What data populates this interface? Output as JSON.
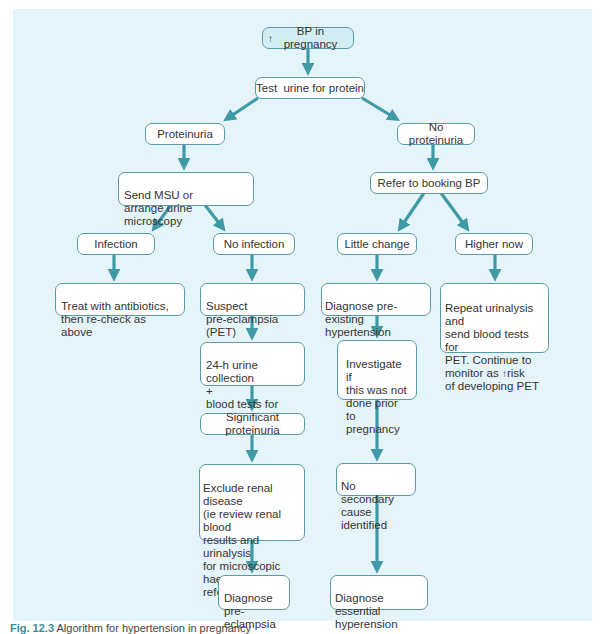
{
  "diagram": {
    "colors": {
      "panel_background": "#e5f4f9",
      "arrow": "#3f9aa6",
      "node_border": "#5a9aa5",
      "node_fill": "#ffffff"
    },
    "nodes": {
      "root": {
        "arrow_glyph": "↑",
        "label": "BP in pregnancy"
      },
      "test_urine": {
        "label": "Test  urine for protein"
      },
      "proteinuria": {
        "label": "Proteinuria"
      },
      "send_msu": {
        "label": "Send MSU or\narrange urine microscopy"
      },
      "infection": {
        "label": "Infection"
      },
      "no_infection": {
        "label": "No infection"
      },
      "treat_antibiotics": {
        "label": "Treat with antibiotics,\nthen re-check as above"
      },
      "suspect_pet": {
        "label": "Suspect\npre-eclampsia (PET)"
      },
      "urine_collection": {
        "label": "24-h urine collection\n+\nblood tests for PET"
      },
      "significant_proteinuria": {
        "label": "Significant proteinuria"
      },
      "exclude_renal": {
        "label": "Exclude renal disease\n(ie review renal blood\nresults and urinalysis\nfor microscopic\nhaematuria)\nrefer if abnormal"
      },
      "diagnose_pre_eclampsia": {
        "label": "Diagnose\npre-eclampsia"
      },
      "no_proteinuria": {
        "label": "No proteinuria"
      },
      "refer_booking": {
        "label": "Refer to booking BP"
      },
      "little_change": {
        "label": "Little change"
      },
      "higher_now": {
        "label": "Higher now"
      },
      "diagnose_preexisting": {
        "label": "Diagnose pre-existing\nhypertension"
      },
      "repeat_urinalysis": {
        "label_part1": "Repeat urinalysis and\nsend blood tests for\nPET. Continue to\nmonitor as ",
        "arrow_glyph": "↑",
        "label_part2": "risk\nof developing PET"
      },
      "investigate": {
        "label": "Investigate if\nthis was not\ndone prior to\npregnancy"
      },
      "no_secondary": {
        "label": "No secondary\ncause identified"
      },
      "diagnose_essential": {
        "label": "Diagnose essential\nhyperension"
      }
    },
    "edges": [
      [
        "root",
        "test_urine"
      ],
      [
        "test_urine",
        "proteinuria"
      ],
      [
        "test_urine",
        "no_proteinuria"
      ],
      [
        "proteinuria",
        "send_msu"
      ],
      [
        "send_msu",
        "infection"
      ],
      [
        "send_msu",
        "no_infection"
      ],
      [
        "infection",
        "treat_antibiotics"
      ],
      [
        "no_infection",
        "suspect_pet"
      ],
      [
        "suspect_pet",
        "urine_collection"
      ],
      [
        "urine_collection",
        "significant_proteinuria"
      ],
      [
        "significant_proteinuria",
        "exclude_renal"
      ],
      [
        "exclude_renal",
        "diagnose_pre_eclampsia"
      ],
      [
        "no_proteinuria",
        "refer_booking"
      ],
      [
        "refer_booking",
        "little_change"
      ],
      [
        "refer_booking",
        "higher_now"
      ],
      [
        "little_change",
        "diagnose_preexisting"
      ],
      [
        "higher_now",
        "repeat_urinalysis"
      ],
      [
        "diagnose_preexisting",
        "investigate"
      ],
      [
        "investigate",
        "no_secondary"
      ],
      [
        "no_secondary",
        "diagnose_essential"
      ]
    ]
  },
  "caption": {
    "figure_label": "Fig. 12.3",
    "text": "Algorithm for hypertension in pregnancy"
  }
}
